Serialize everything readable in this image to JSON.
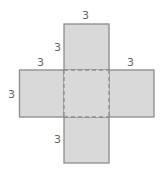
{
  "diagram": {
    "fill_color": "#d9d9d9",
    "stroke_color": "#8a8a8a",
    "label_color": "#666666",
    "faces": [
      "top",
      "left",
      "center",
      "right",
      "bottom"
    ],
    "labels": {
      "top_width": "3",
      "top_height": "3",
      "left_top": "3",
      "left_height": "3",
      "right_top": "3",
      "bottom_height": "3"
    }
  }
}
